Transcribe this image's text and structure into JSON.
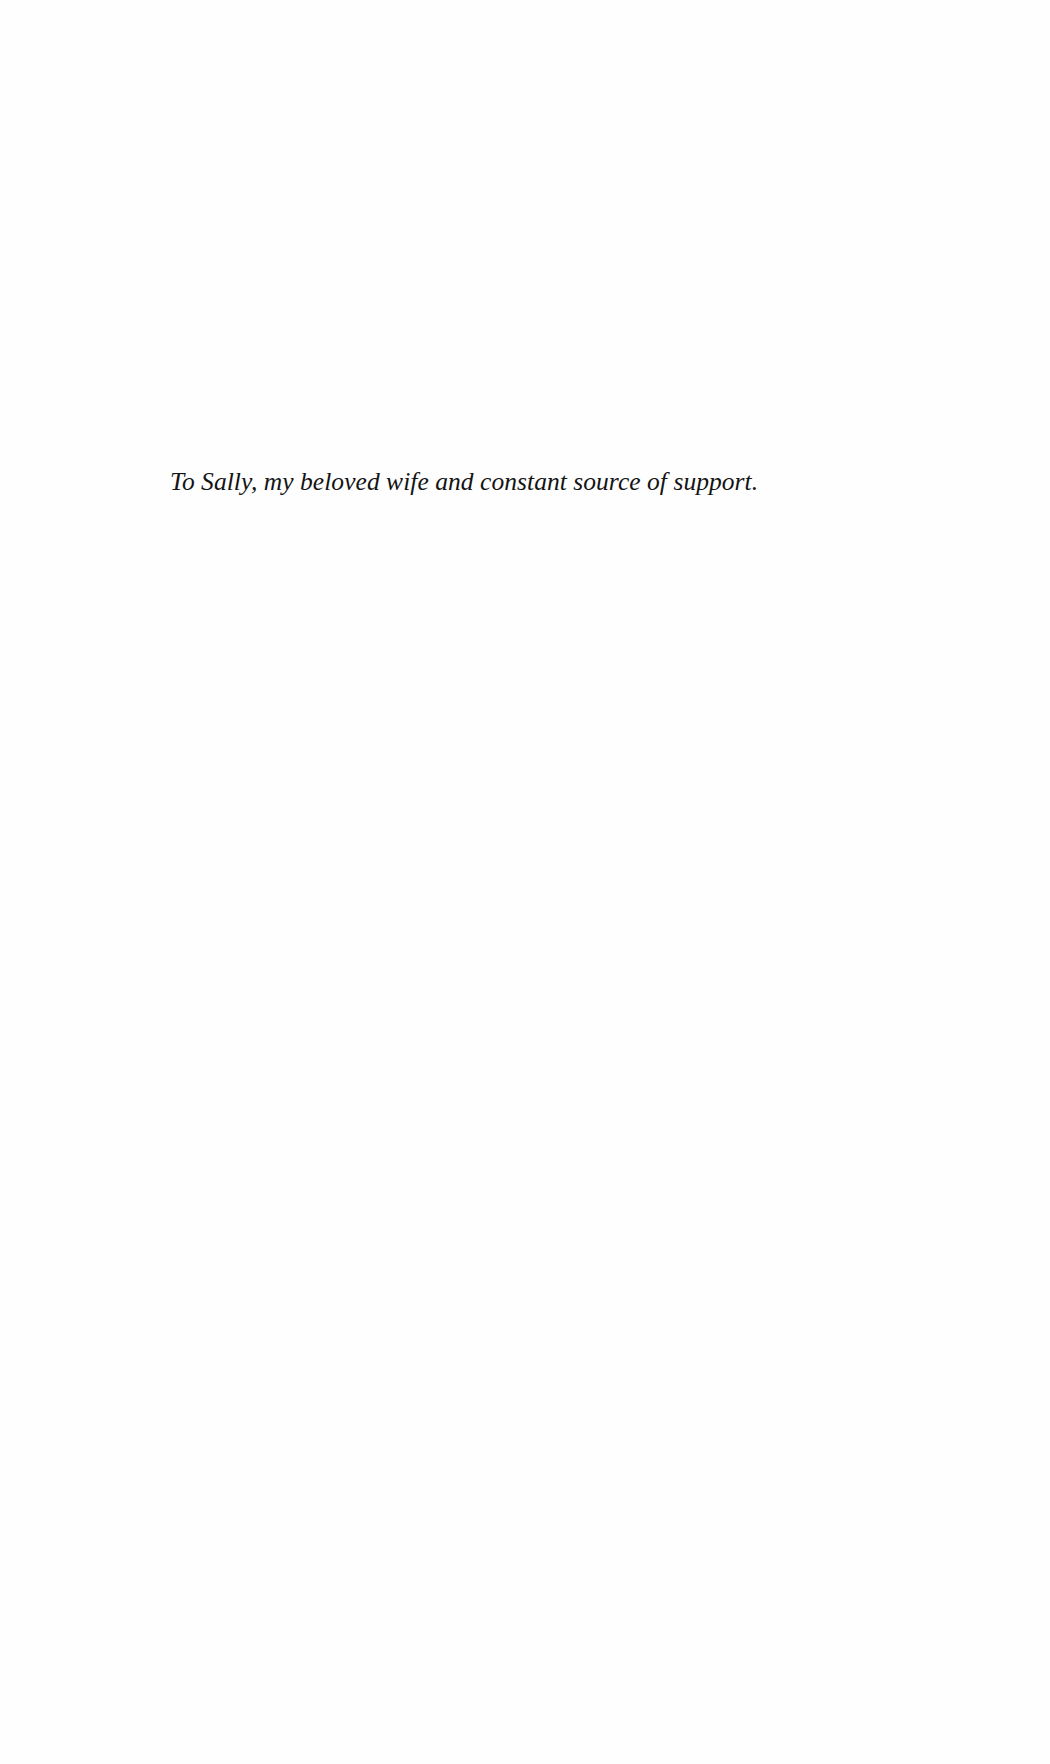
{
  "page": {
    "type": "dedication",
    "background_color": "#fefefe",
    "text_color": "#141414"
  },
  "dedication": {
    "text": "To Sally, my beloved wife and constant source of support."
  }
}
